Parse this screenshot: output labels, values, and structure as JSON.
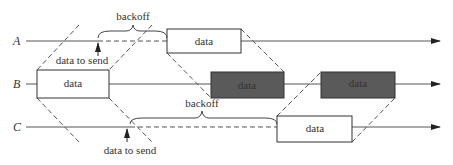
{
  "stations": [
    {
      "name": "A"
    },
    {
      "name": "B"
    },
    {
      "name": "C"
    }
  ],
  "frames": {
    "a_data": "data",
    "b_data_1": "data",
    "b_data_2": "data",
    "b_data_3": "data",
    "c_data": "data"
  },
  "annotations": {
    "backoff_a": "backoff",
    "backoff_c": "backoff",
    "data_to_send_a": "data to send",
    "data_to_send_c": "data to send"
  },
  "colors": {
    "line": "#555555",
    "dark_frame": "#5a5a5a",
    "light_frame": "#ffffff"
  }
}
